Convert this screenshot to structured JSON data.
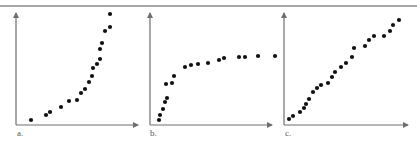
{
  "figure": {
    "top_rule": {
      "x1": 0,
      "x2": 417,
      "y": 6,
      "color": "#8a8a8a"
    },
    "axis_color": "#6e6e6e",
    "dot_color": "#111111",
    "dot_radius": 2.1
  },
  "chart_data": [
    {
      "type": "scatter",
      "panel": "a",
      "label": "a.",
      "title": "",
      "xlabel": "",
      "ylabel": "",
      "description": "Exponential / accelerating growth",
      "axes_px": {
        "x0": 16,
        "x1": 138,
        "y0": 125,
        "y1": 13
      },
      "label_pos": {
        "x": 17,
        "y": 129
      },
      "points_px": [
        [
          31,
          120
        ],
        [
          46,
          115
        ],
        [
          50,
          112
        ],
        [
          61,
          107
        ],
        [
          69,
          101
        ],
        [
          77,
          100
        ],
        [
          81,
          93
        ],
        [
          85,
          89
        ],
        [
          89,
          82
        ],
        [
          92,
          76
        ],
        [
          93,
          68
        ],
        [
          97,
          64
        ],
        [
          100,
          59
        ],
        [
          100,
          49
        ],
        [
          102,
          43
        ],
        [
          105,
          31
        ],
        [
          110,
          27
        ],
        [
          110,
          14
        ]
      ]
    },
    {
      "type": "scatter",
      "panel": "b",
      "label": "b.",
      "title": "",
      "xlabel": "",
      "ylabel": "",
      "description": "Logarithmic / saturating growth",
      "axes_px": {
        "x0": 150,
        "x1": 272,
        "y0": 125,
        "y1": 13
      },
      "label_pos": {
        "x": 150,
        "y": 129
      },
      "points_px": [
        [
          159,
          120
        ],
        [
          160,
          115
        ],
        [
          163,
          109
        ],
        [
          165,
          102
        ],
        [
          167,
          98
        ],
        [
          166,
          84
        ],
        [
          172,
          83
        ],
        [
          174,
          76
        ],
        [
          185,
          67
        ],
        [
          191,
          65
        ],
        [
          198,
          64
        ],
        [
          208,
          63
        ],
        [
          219,
          60
        ],
        [
          224,
          58
        ],
        [
          239,
          57
        ],
        [
          245,
          57
        ],
        [
          258,
          56
        ],
        [
          275,
          56
        ]
      ]
    },
    {
      "type": "scatter",
      "panel": "c",
      "label": "c.",
      "title": "",
      "xlabel": "",
      "ylabel": "",
      "description": "Linear growth",
      "axes_px": {
        "x0": 284,
        "x1": 408,
        "y0": 125,
        "y1": 13
      },
      "label_pos": {
        "x": 285,
        "y": 129
      },
      "points_px": [
        [
          289,
          119
        ],
        [
          293,
          116
        ],
        [
          300,
          112
        ],
        [
          304,
          108
        ],
        [
          306,
          104
        ],
        [
          309,
          99
        ],
        [
          313,
          92
        ],
        [
          317,
          88
        ],
        [
          321,
          85
        ],
        [
          328,
          83
        ],
        [
          332,
          77
        ],
        [
          335,
          72
        ],
        [
          341,
          67
        ],
        [
          346,
          63
        ],
        [
          352,
          57
        ],
        [
          354,
          48
        ],
        [
          365,
          46
        ],
        [
          369,
          40
        ],
        [
          374,
          36
        ],
        [
          384,
          36
        ],
        [
          390,
          31
        ],
        [
          393,
          25
        ],
        [
          399,
          20
        ]
      ]
    }
  ]
}
